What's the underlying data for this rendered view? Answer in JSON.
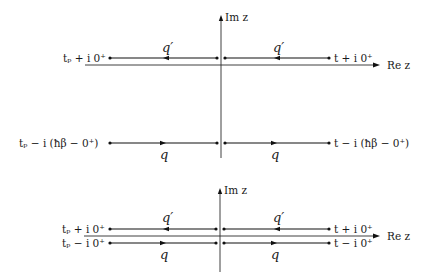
{
  "figure": {
    "colors": {
      "line": "#111111",
      "axis": "#2a2a2a",
      "background": "#ffffff"
    },
    "top_panel": {
      "axis_labels": {
        "imaginary": "Im z",
        "real": "Re z"
      },
      "upper_branch": {
        "label": "q′",
        "start_label": "t + i 0⁺",
        "end_label": "tₚ + i 0⁺",
        "direction": "right-to-left"
      },
      "lower_branch": {
        "label": "q",
        "start_label": "tₚ − i (ħβ − 0⁺)",
        "end_label": "t − i (ħβ − 0⁺)",
        "direction": "left-to-right"
      }
    },
    "bottom_panel": {
      "axis_labels": {
        "imaginary": "Im z",
        "real": "Re z"
      },
      "upper_branch": {
        "label": "q′",
        "left_label": "tₚ + i 0⁺",
        "right_label": "t + i 0⁺",
        "direction": "right-to-left"
      },
      "lower_branch": {
        "label": "q",
        "left_label": "tₚ − i 0⁺",
        "right_label": "t − i 0⁺",
        "direction": "left-to-right"
      }
    }
  }
}
